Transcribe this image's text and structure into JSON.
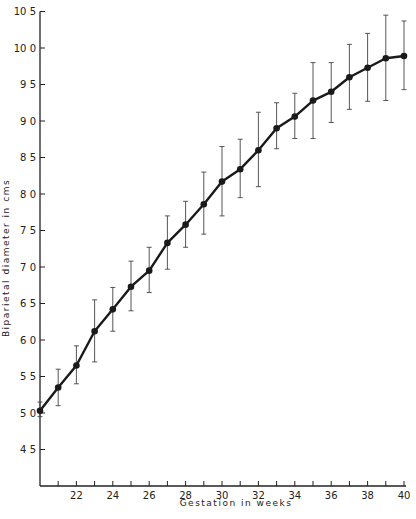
{
  "chart_data": {
    "type": "line",
    "title": "",
    "xlabel": "Gestation in weeks",
    "ylabel": "Biparietal diameter in cms",
    "xlim": [
      20,
      40
    ],
    "ylim": [
      4.0,
      10.5
    ],
    "x_ticks": [
      20,
      21,
      22,
      23,
      24,
      25,
      26,
      27,
      28,
      29,
      30,
      31,
      32,
      33,
      34,
      35,
      36,
      37,
      38,
      39,
      40
    ],
    "x_tick_labels": [
      "22",
      "24",
      "26",
      "28",
      "30",
      "32",
      "34",
      "36",
      "38",
      "40"
    ],
    "x_tick_label_values": [
      22,
      24,
      26,
      28,
      30,
      32,
      34,
      36,
      38,
      40
    ],
    "y_ticks": [
      4.5,
      5.0,
      5.5,
      6.0,
      6.5,
      7.0,
      7.5,
      8.0,
      8.5,
      9.0,
      9.5,
      10.0,
      10.5
    ],
    "y_tick_labels": [
      "4 5",
      "5 0",
      "5 5",
      "6 0",
      "6 5",
      "7 0",
      "7 5",
      "8 0",
      "8 5",
      "9 0",
      "9 5",
      "10 0",
      "10 5"
    ],
    "grid": false,
    "legend": null,
    "series": [
      {
        "name": "Mean biparietal diameter",
        "x": [
          20,
          21,
          22,
          23,
          24,
          25,
          26,
          27,
          28,
          29,
          30,
          31,
          32,
          33,
          34,
          35,
          36,
          37,
          38,
          39,
          40
        ],
        "values": [
          5.03,
          5.35,
          5.65,
          6.12,
          6.42,
          6.73,
          6.95,
          7.33,
          7.58,
          7.86,
          8.17,
          8.34,
          8.6,
          8.9,
          9.06,
          9.28,
          9.4,
          9.6,
          9.73,
          9.86,
          9.89
        ],
        "error_upper": [
          5.15,
          5.6,
          5.92,
          6.55,
          6.72,
          7.08,
          7.27,
          7.7,
          7.9,
          8.3,
          8.65,
          8.75,
          9.12,
          9.25,
          9.38,
          9.8,
          9.8,
          10.05,
          10.2,
          10.45,
          10.37
        ],
        "error_lower": [
          4.95,
          5.1,
          5.4,
          5.7,
          6.12,
          6.4,
          6.65,
          6.97,
          7.27,
          7.45,
          7.7,
          7.95,
          8.1,
          8.62,
          8.76,
          8.76,
          8.98,
          9.16,
          9.27,
          9.28,
          9.43
        ]
      }
    ]
  },
  "colors": {
    "line": "#1a1a1a",
    "axis": "#222222",
    "error_bar": "#444444",
    "background": "#ffffff"
  }
}
